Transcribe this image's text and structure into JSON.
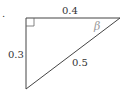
{
  "diagram": {
    "type": "right-triangle",
    "bullet": ".",
    "sides": {
      "top": "0.4",
      "left": "0.3",
      "hypotenuse": "0.5"
    },
    "angle_label": "β",
    "right_angle_marker": true,
    "colors": {
      "stroke": "#444444",
      "text": "#333333",
      "angle_label": "#999999"
    }
  }
}
